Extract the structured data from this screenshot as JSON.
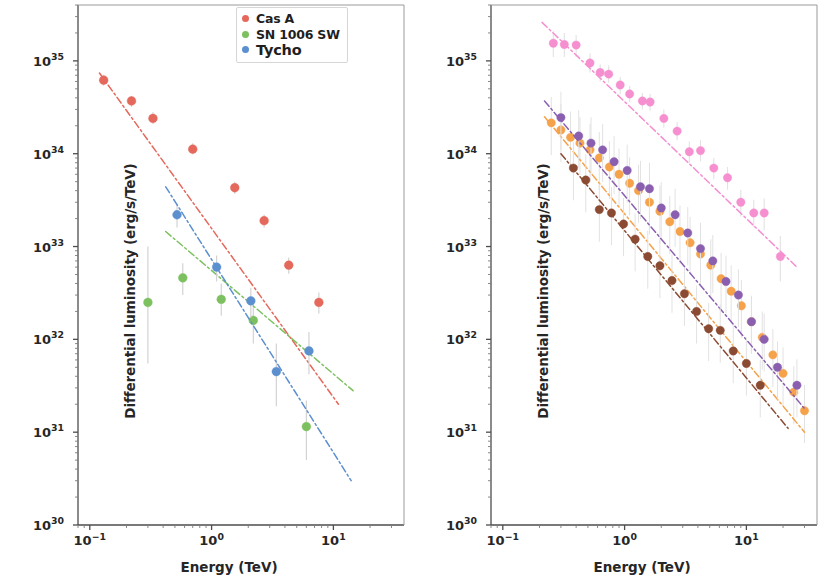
{
  "figure": {
    "width": 825,
    "height": 581,
    "background": "#ffffff"
  },
  "axis_labels": {
    "xlabel": "Energy (TeV)",
    "ylabel": "Differential luminosity (erg/s/TeV)"
  },
  "ticks": {
    "x_exponents": [
      -1,
      0,
      1
    ],
    "x_labels": [
      "10⁻¹",
      "10⁰",
      "10¹"
    ],
    "y_exponents": [
      30,
      31,
      32,
      33,
      34,
      35
    ],
    "y_labels": [
      "10³⁰",
      "10³¹",
      "10³²",
      "10³³",
      "10³⁴",
      "10³⁵"
    ]
  },
  "chart_data": [
    {
      "panel": "left",
      "type": "scatter",
      "title": "",
      "xlabel": "Energy (TeV)",
      "ylabel": "Differential luminosity (erg/s/TeV)",
      "xscale": "log",
      "yscale": "log",
      "xlim": [
        0.08,
        38
      ],
      "ylim": [
        1e+30,
        4e+35
      ],
      "grid": false,
      "legend_position": "top-right",
      "series": [
        {
          "name": "Cas A",
          "color": "#e4685c",
          "marker": "circle",
          "errorbar_color": "#cfcfcf",
          "fit_line": {
            "style": "dashdot",
            "x": [
              0.12,
              11.0
            ],
            "y": [
              7.4e+34,
              2e+31
            ]
          },
          "points": [
            {
              "x": 0.13,
              "y": 6.2e+34,
              "yerr_lo": 5.4e+34,
              "yerr_hi": 7.1e+34
            },
            {
              "x": 0.22,
              "y": 3.7e+34,
              "yerr_lo": 3.2e+34,
              "yerr_hi": 4.2e+34
            },
            {
              "x": 0.33,
              "y": 2.4e+34,
              "yerr_lo": 2.1e+34,
              "yerr_hi": 2.8e+34
            },
            {
              "x": 0.7,
              "y": 1.12e+34,
              "yerr_lo": 9.8e+33,
              "yerr_hi": 1.3e+34
            },
            {
              "x": 1.55,
              "y": 4.3e+33,
              "yerr_lo": 3.7e+33,
              "yerr_hi": 5e+33
            },
            {
              "x": 2.7,
              "y": 1.9e+33,
              "yerr_lo": 1.6e+33,
              "yerr_hi": 2.2e+33
            },
            {
              "x": 4.3,
              "y": 6.3e+32,
              "yerr_lo": 5.1e+32,
              "yerr_hi": 7.6e+32
            },
            {
              "x": 7.6,
              "y": 2.5e+32,
              "yerr_lo": 1.9e+32,
              "yerr_hi": 3.2e+32
            }
          ]
        },
        {
          "name": "SN 1006 SW",
          "color": "#7cc05f",
          "marker": "circle",
          "errorbar_color": "#cfcfcf",
          "fit_line": {
            "style": "dashdot",
            "x": [
              0.42,
              14.5
            ],
            "y": [
              1.45e+33,
              2.8e+31
            ]
          },
          "points": [
            {
              "x": 0.3,
              "y": 2.5e+32,
              "yerr_lo": 5.5e+31,
              "yerr_hi": 1e+33
            },
            {
              "x": 0.58,
              "y": 4.6e+32,
              "yerr_lo": 3e+32,
              "yerr_hi": 6.6e+32
            },
            {
              "x": 1.2,
              "y": 2.7e+32,
              "yerr_lo": 1.8e+32,
              "yerr_hi": 4e+32
            },
            {
              "x": 2.2,
              "y": 1.6e+32,
              "yerr_lo": 9e+31,
              "yerr_hi": 2.5e+32
            },
            {
              "x": 6.0,
              "y": 1.15e+31,
              "yerr_lo": 5e+30,
              "yerr_hi": 2.2e+31
            }
          ]
        },
        {
          "name": "Tycho",
          "color": "#5b8fd0",
          "marker": "circle",
          "errorbar_color": "#cfcfcf",
          "fit_line": {
            "style": "dashdot",
            "x": [
              0.42,
              14.0
            ],
            "y": [
              4.4e+33,
              3e+30
            ]
          },
          "points": [
            {
              "x": 0.52,
              "y": 2.2e+33,
              "yerr_lo": 1.6e+33,
              "yerr_hi": 2.9e+33
            },
            {
              "x": 1.1,
              "y": 6e+32,
              "yerr_lo": 4.2e+32,
              "yerr_hi": 8e+32
            },
            {
              "x": 2.1,
              "y": 2.6e+32,
              "yerr_lo": 1.7e+32,
              "yerr_hi": 3.6e+32
            },
            {
              "x": 3.4,
              "y": 4.5e+31,
              "yerr_lo": 1.9e+31,
              "yerr_hi": 9e+31
            },
            {
              "x": 6.3,
              "y": 7.5e+31,
              "yerr_lo": 4.2e+31,
              "yerr_hi": 1.2e+32
            }
          ]
        }
      ]
    },
    {
      "panel": "right",
      "type": "scatter",
      "title": "",
      "xlabel": "Energy (TeV)",
      "ylabel": "Differential luminosity (erg/s/TeV)",
      "xscale": "log",
      "yscale": "log",
      "xlim": [
        0.08,
        38
      ],
      "ylim": [
        1e+30,
        4e+35
      ],
      "grid": false,
      "legend_position": "top-right",
      "series": [
        {
          "name": "HESS J1640-465",
          "color": "#f58fd0",
          "marker": "circle",
          "errorbar_color": "#e2e2e2",
          "fit_line": {
            "style": "dashdot",
            "x": [
              0.21,
              26.0
            ],
            "y": [
              2.6e+35,
              6e+32
            ]
          },
          "points": [
            {
              "x": 0.26,
              "y": 1.55e+35,
              "yerr_lo": 1.1e+35,
              "yerr_hi": 2.1e+35
            },
            {
              "x": 0.32,
              "y": 1.5e+35,
              "yerr_lo": 1.1e+35,
              "yerr_hi": 2e+35
            },
            {
              "x": 0.4,
              "y": 1.48e+35,
              "yerr_lo": 1.1e+35,
              "yerr_hi": 1.9e+35
            },
            {
              "x": 0.52,
              "y": 9.5e+34,
              "yerr_lo": 7.5e+34,
              "yerr_hi": 1.2e+35
            },
            {
              "x": 0.63,
              "y": 7.5e+34,
              "yerr_lo": 6e+34,
              "yerr_hi": 9.2e+34
            },
            {
              "x": 0.74,
              "y": 7.2e+34,
              "yerr_lo": 5.8e+34,
              "yerr_hi": 8.9e+34
            },
            {
              "x": 0.92,
              "y": 5.5e+34,
              "yerr_lo": 4.4e+34,
              "yerr_hi": 6.7e+34
            },
            {
              "x": 1.1,
              "y": 4.4e+34,
              "yerr_lo": 3.6e+34,
              "yerr_hi": 5.4e+34
            },
            {
              "x": 1.4,
              "y": 3.7e+34,
              "yerr_lo": 3e+34,
              "yerr_hi": 4.5e+34
            },
            {
              "x": 1.62,
              "y": 3.6e+34,
              "yerr_lo": 2.9e+34,
              "yerr_hi": 4.4e+34
            },
            {
              "x": 2.1,
              "y": 2.4e+34,
              "yerr_lo": 1.9e+34,
              "yerr_hi": 3e+34
            },
            {
              "x": 2.7,
              "y": 1.75e+34,
              "yerr_lo": 1.4e+34,
              "yerr_hi": 2.2e+34
            },
            {
              "x": 3.4,
              "y": 1.05e+34,
              "yerr_lo": 8e+33,
              "yerr_hi": 1.35e+34
            },
            {
              "x": 4.2,
              "y": 1.08e+34,
              "yerr_lo": 8.3e+33,
              "yerr_hi": 1.4e+34
            },
            {
              "x": 5.4,
              "y": 7e+33,
              "yerr_lo": 5.3e+33,
              "yerr_hi": 9e+33
            },
            {
              "x": 7.0,
              "y": 5.5e+33,
              "yerr_lo": 4.1e+33,
              "yerr_hi": 7.2e+33
            },
            {
              "x": 9.0,
              "y": 3e+33,
              "yerr_lo": 2.1e+33,
              "yerr_hi": 4.1e+33
            },
            {
              "x": 11.5,
              "y": 2.3e+33,
              "yerr_lo": 1.6e+33,
              "yerr_hi": 3.2e+33
            },
            {
              "x": 14.0,
              "y": 2.3e+33,
              "yerr_lo": 1.5e+33,
              "yerr_hi": 3.3e+33
            },
            {
              "x": 19.0,
              "y": 7.8e+32,
              "yerr_lo": 4.2e+32,
              "yerr_hi": 1.3e+33
            }
          ]
        },
        {
          "name": "RX J1713.7-3946",
          "color": "#f5a24b",
          "marker": "circle",
          "errorbar_color": "#e2e2e2",
          "fit_line": {
            "style": "dashdot",
            "x": [
              0.22,
              30.0
            ],
            "y": [
              2.5e+34,
              1e+31
            ]
          },
          "points": [
            {
              "x": 0.25,
              "y": 2.15e+34
            },
            {
              "x": 0.3,
              "y": 1.8e+34
            },
            {
              "x": 0.36,
              "y": 1.5e+34
            },
            {
              "x": 0.43,
              "y": 1.3e+34
            },
            {
              "x": 0.52,
              "y": 1.1e+34
            },
            {
              "x": 0.62,
              "y": 9e+33
            },
            {
              "x": 0.75,
              "y": 7.2e+33
            },
            {
              "x": 0.9,
              "y": 6e+33
            },
            {
              "x": 1.1,
              "y": 4.8e+33
            },
            {
              "x": 1.3,
              "y": 4e+33
            },
            {
              "x": 1.6,
              "y": 3e+33
            },
            {
              "x": 1.95,
              "y": 2.4e+33
            },
            {
              "x": 2.35,
              "y": 1.85e+33
            },
            {
              "x": 2.85,
              "y": 1.45e+33
            },
            {
              "x": 3.45,
              "y": 1.1e+33
            },
            {
              "x": 4.2,
              "y": 8.3e+32
            },
            {
              "x": 5.1,
              "y": 6.3e+32
            },
            {
              "x": 6.2,
              "y": 4.5e+32
            },
            {
              "x": 7.5,
              "y": 3.3e+32
            },
            {
              "x": 9.1,
              "y": 2.3e+32
            },
            {
              "x": 11.0,
              "y": 1.55e+32
            },
            {
              "x": 13.5,
              "y": 1.05e+32
            },
            {
              "x": 16.5,
              "y": 6.8e+31
            },
            {
              "x": 20.0,
              "y": 4.3e+31
            },
            {
              "x": 24.5,
              "y": 2.7e+31
            },
            {
              "x": 30.0,
              "y": 1.7e+31
            }
          ]
        },
        {
          "name": "HESS J1731-347",
          "color": "#8a5fb0",
          "marker": "circle",
          "errorbar_color": "#e2e2e2",
          "fit_line": {
            "style": "dashdot",
            "x": [
              0.22,
              30.0
            ],
            "y": [
              3.7e+34,
              1.8e+31
            ]
          },
          "points": [
            {
              "x": 0.3,
              "y": 2.45e+34
            },
            {
              "x": 0.42,
              "y": 1.55e+34
            },
            {
              "x": 0.53,
              "y": 1.3e+34
            },
            {
              "x": 0.66,
              "y": 1.1e+34
            },
            {
              "x": 0.82,
              "y": 8.2e+33
            },
            {
              "x": 1.05,
              "y": 6.6e+33
            },
            {
              "x": 1.35,
              "y": 4.4e+33
            },
            {
              "x": 1.6,
              "y": 4.2e+33
            },
            {
              "x": 2.0,
              "y": 2.6e+33
            },
            {
              "x": 2.6,
              "y": 2.2e+33
            },
            {
              "x": 3.3,
              "y": 1.4e+33
            },
            {
              "x": 4.2,
              "y": 9.5e+32
            },
            {
              "x": 5.3,
              "y": 7e+32
            },
            {
              "x": 6.8,
              "y": 4.2e+32
            },
            {
              "x": 8.6,
              "y": 3e+32
            },
            {
              "x": 11.0,
              "y": 1.55e+32
            },
            {
              "x": 14.0,
              "y": 1e+32
            },
            {
              "x": 18.0,
              "y": 5e+31
            },
            {
              "x": 26.0,
              "y": 3.2e+31
            }
          ]
        },
        {
          "name": "Vela Jr",
          "color": "#8b4a32",
          "marker": "circle",
          "errorbar_color": "#e2e2e2",
          "fit_line": {
            "style": "dashdot",
            "x": [
              0.3,
              22.0
            ],
            "y": [
              1e+34,
              1.1e+31
            ]
          },
          "points": [
            {
              "x": 0.38,
              "y": 7e+33
            },
            {
              "x": 0.48,
              "y": 5.2e+33
            },
            {
              "x": 0.62,
              "y": 2.5e+33
            },
            {
              "x": 0.78,
              "y": 2.3e+33
            },
            {
              "x": 0.98,
              "y": 1.75e+33
            },
            {
              "x": 1.22,
              "y": 1.2e+33
            },
            {
              "x": 1.55,
              "y": 7.8e+32
            },
            {
              "x": 1.95,
              "y": 6.2e+32
            },
            {
              "x": 2.45,
              "y": 4.3e+32
            },
            {
              "x": 3.1,
              "y": 3.1e+32
            },
            {
              "x": 3.9,
              "y": 2e+32
            },
            {
              "x": 4.9,
              "y": 1.3e+32
            },
            {
              "x": 6.1,
              "y": 1.25e+32
            },
            {
              "x": 7.8,
              "y": 7.5e+31
            },
            {
              "x": 10.0,
              "y": 5.5e+31
            },
            {
              "x": 13.0,
              "y": 3.2e+31
            }
          ]
        }
      ]
    }
  ],
  "panels": [
    {
      "id": "left",
      "legend": {
        "entries": [
          {
            "label": "Cas A",
            "color": "#e4685c"
          },
          {
            "label": "SN 1006 SW",
            "color": "#7cc05f"
          },
          {
            "label": "Tycho",
            "color": "#5b8fd0"
          }
        ]
      }
    },
    {
      "id": "right",
      "legend": {
        "entries": [
          {
            "label": "HESS J1640-465",
            "color": "#f58fd0"
          },
          {
            "label": "RX J1713.7-3946",
            "color": "#f5a24b"
          },
          {
            "label": "HESS J1731-347",
            "color": "#8a5fb0"
          },
          {
            "label": "Vela Jr",
            "color": "#8b4a32"
          }
        ]
      }
    }
  ]
}
